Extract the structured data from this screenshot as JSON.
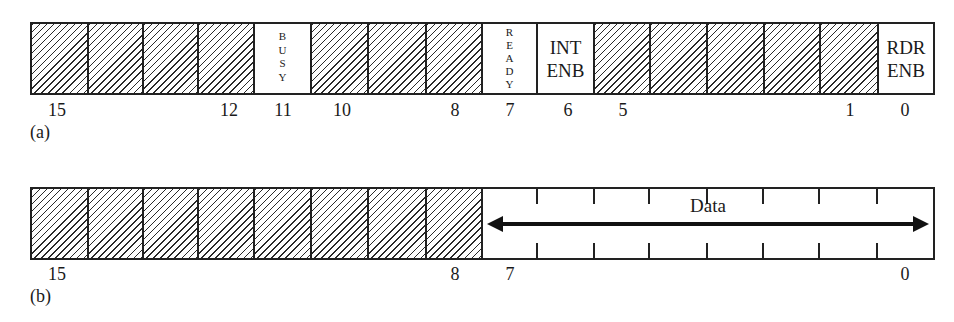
{
  "figure": {
    "panel_a": {
      "caption": "(a)",
      "register_bits": 16,
      "fields": [
        {
          "bit": 15,
          "type": "reserved"
        },
        {
          "bit": 14,
          "type": "reserved"
        },
        {
          "bit": 13,
          "type": "reserved"
        },
        {
          "bit": 12,
          "type": "reserved"
        },
        {
          "bit": 11,
          "type": "flag",
          "label": "BUSY",
          "orientation": "vertical"
        },
        {
          "bit": 10,
          "type": "reserved"
        },
        {
          "bit": 9,
          "type": "reserved"
        },
        {
          "bit": 8,
          "type": "reserved"
        },
        {
          "bit": 7,
          "type": "flag",
          "label": "READY",
          "orientation": "vertical"
        },
        {
          "bit": 6,
          "type": "flag",
          "label_line1": "INT",
          "label_line2": "ENB"
        },
        {
          "bit": 5,
          "type": "reserved"
        },
        {
          "bit": 4,
          "type": "reserved"
        },
        {
          "bit": 3,
          "type": "reserved"
        },
        {
          "bit": 2,
          "type": "reserved"
        },
        {
          "bit": 1,
          "type": "reserved"
        },
        {
          "bit": 0,
          "type": "flag",
          "label_line1": "RDR",
          "label_line2": "ENB"
        }
      ],
      "busy_letters": [
        "B",
        "U",
        "S",
        "Y"
      ],
      "ready_letters": [
        "R",
        "E",
        "A",
        "D",
        "Y"
      ],
      "int_enb": {
        "line1": "INT",
        "line2": "ENB"
      },
      "rdr_enb": {
        "line1": "RDR",
        "line2": "ENB"
      },
      "bit_numbers_shown": [
        "15",
        "12",
        "11",
        "10",
        "8",
        "7",
        "6",
        "5",
        "1",
        "0"
      ]
    },
    "panel_b": {
      "caption": "(b)",
      "register_bits": 16,
      "reserved_range": "15-8",
      "data_field": {
        "label": "Data",
        "range": "7-0"
      },
      "bit_numbers_shown": [
        "15",
        "8",
        "7",
        "0"
      ]
    },
    "colors": {
      "line": "#222222",
      "background": "#ffffff",
      "hatch": "#2a2a2a"
    }
  }
}
